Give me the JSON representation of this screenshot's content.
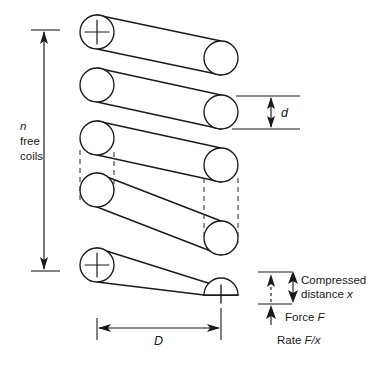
{
  "figure": {
    "type": "helical-compression-spring-diagram",
    "background_color": "#ffffff",
    "line_color": "#1a1a1a"
  },
  "labels": {
    "free_coils_line1": "n",
    "free_coils_line2": "free",
    "free_coils_line3": "coils",
    "wire_diameter": "d",
    "mean_diameter": "D",
    "compressed_line1": "Compressed",
    "compressed_line2_prefix": "distance ",
    "compressed_line2_var": "x",
    "force_prefix": "Force ",
    "force_var": "F",
    "rate_prefix": "Rate ",
    "rate_var": "F/x"
  },
  "geometry": {
    "coil_count_drawn": 5,
    "left_coil_centers_y": [
      32,
      85,
      138,
      190,
      265
    ],
    "right_coil_centers_y": [
      58,
      112,
      165,
      238,
      295
    ],
    "left_coil_center_x": 97,
    "right_coil_center_x": 221,
    "coil_radius": 17,
    "free_coils_dim_top_y": 30,
    "free_coils_dim_bottom_y": 271,
    "free_coils_dim_x": 44,
    "mean_diameter_dim_y": 328,
    "mean_diameter_left_x": 97,
    "mean_diameter_right_x": 221,
    "wire_diameter_dim_x": 284,
    "wire_diameter_top_y": 96,
    "wire_diameter_bottom_y": 129,
    "compressed_dim_x": 273,
    "compressed_top_y": 272,
    "compressed_bottom_y": 304,
    "force_arrow_x": 273,
    "force_arrow_base_y": 325,
    "force_arrow_tip_y": 306
  }
}
